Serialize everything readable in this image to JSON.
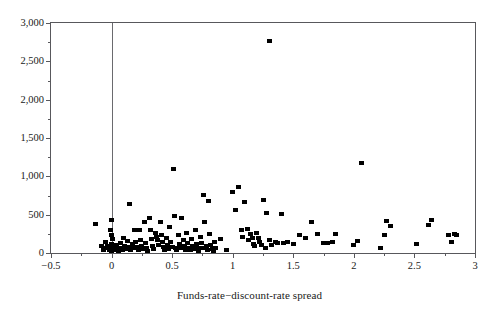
{
  "chart_data": {
    "type": "scatter",
    "title": "",
    "xlabel": "Funds-rate−discount-rate spread",
    "ylabel": "",
    "xlim": [
      -0.5,
      3.0
    ],
    "ylim": [
      0,
      3000
    ],
    "xticks": [
      -0.5,
      0,
      0.5,
      1,
      1.5,
      2,
      2.5,
      3
    ],
    "xticklabels": [
      "−0.5",
      "0",
      "0.5",
      "1",
      "1.5",
      "2",
      "2.5",
      "3"
    ],
    "xminorticks": [
      -0.25,
      0.25,
      0.75,
      1.25,
      1.75,
      2.25,
      2.75
    ],
    "yticks": [
      0,
      500,
      1000,
      1500,
      2000,
      2500,
      3000
    ],
    "yticklabels": [
      "0",
      "500",
      "1,000",
      "1,500",
      "2,000",
      "2,500",
      "3,000"
    ],
    "yminorticks": [
      250,
      750,
      1250,
      1750,
      2250,
      2750
    ],
    "grid": false,
    "legend": null,
    "marker": "square",
    "marker_color": "#000000",
    "reference_lines": [
      {
        "orientation": "vertical",
        "value": 0
      }
    ],
    "points": [
      [
        -0.13,
        375
      ],
      [
        -0.08,
        95
      ],
      [
        -0.07,
        40
      ],
      [
        -0.05,
        150
      ],
      [
        -0.04,
        60
      ],
      [
        -0.03,
        95
      ],
      [
        -0.02,
        35
      ],
      [
        -0.01,
        300
      ],
      [
        0.0,
        430
      ],
      [
        0.0,
        230
      ],
      [
        0.0,
        120
      ],
      [
        0.0,
        60
      ],
      [
        0.0,
        30
      ],
      [
        0.01,
        180
      ],
      [
        0.02,
        90
      ],
      [
        0.03,
        45
      ],
      [
        0.04,
        110
      ],
      [
        0.05,
        60
      ],
      [
        0.06,
        30
      ],
      [
        0.07,
        135
      ],
      [
        0.08,
        70
      ],
      [
        0.09,
        35
      ],
      [
        0.1,
        200
      ],
      [
        0.11,
        95
      ],
      [
        0.12,
        50
      ],
      [
        0.13,
        160
      ],
      [
        0.14,
        75
      ],
      [
        0.15,
        640
      ],
      [
        0.16,
        35
      ],
      [
        0.17,
        115
      ],
      [
        0.18,
        60
      ],
      [
        0.19,
        300
      ],
      [
        0.2,
        150
      ],
      [
        0.21,
        80
      ],
      [
        0.22,
        40
      ],
      [
        0.23,
        300
      ],
      [
        0.24,
        175
      ],
      [
        0.25,
        95
      ],
      [
        0.26,
        50
      ],
      [
        0.27,
        410
      ],
      [
        0.28,
        130
      ],
      [
        0.29,
        70
      ],
      [
        0.3,
        30
      ],
      [
        0.31,
        460
      ],
      [
        0.32,
        300
      ],
      [
        0.33,
        180
      ],
      [
        0.34,
        95
      ],
      [
        0.35,
        55
      ],
      [
        0.36,
        260
      ],
      [
        0.37,
        215
      ],
      [
        0.38,
        170
      ],
      [
        0.39,
        110
      ],
      [
        0.4,
        400
      ],
      [
        0.41,
        230
      ],
      [
        0.42,
        140
      ],
      [
        0.43,
        75
      ],
      [
        0.44,
        35
      ],
      [
        0.45,
        190
      ],
      [
        0.46,
        100
      ],
      [
        0.47,
        55
      ],
      [
        0.48,
        345
      ],
      [
        0.49,
        145
      ],
      [
        0.5,
        80
      ],
      [
        0.51,
        1100
      ],
      [
        0.52,
        480
      ],
      [
        0.53,
        60
      ],
      [
        0.54,
        40
      ],
      [
        0.55,
        230
      ],
      [
        0.56,
        120
      ],
      [
        0.57,
        60
      ],
      [
        0.58,
        460
      ],
      [
        0.59,
        170
      ],
      [
        0.6,
        95
      ],
      [
        0.61,
        45
      ],
      [
        0.62,
        260
      ],
      [
        0.63,
        130
      ],
      [
        0.64,
        65
      ],
      [
        0.65,
        35
      ],
      [
        0.66,
        180
      ],
      [
        0.67,
        90
      ],
      [
        0.68,
        50
      ],
      [
        0.69,
        300
      ],
      [
        0.7,
        120
      ],
      [
        0.71,
        60
      ],
      [
        0.72,
        30
      ],
      [
        0.73,
        210
      ],
      [
        0.74,
        130
      ],
      [
        0.75,
        70
      ],
      [
        0.76,
        760
      ],
      [
        0.77,
        400
      ],
      [
        0.78,
        90
      ],
      [
        0.79,
        45
      ],
      [
        0.8,
        680
      ],
      [
        0.81,
        250
      ],
      [
        0.82,
        110
      ],
      [
        0.83,
        55
      ],
      [
        0.84,
        30
      ],
      [
        0.85,
        140
      ],
      [
        0.86,
        70
      ],
      [
        0.9,
        180
      ],
      [
        0.95,
        40
      ],
      [
        1.0,
        790
      ],
      [
        1.02,
        560
      ],
      [
        1.05,
        860
      ],
      [
        1.07,
        300
      ],
      [
        1.08,
        215
      ],
      [
        1.1,
        660
      ],
      [
        1.12,
        310
      ],
      [
        1.13,
        175
      ],
      [
        1.15,
        245
      ],
      [
        1.16,
        200
      ],
      [
        1.17,
        120
      ],
      [
        1.18,
        95
      ],
      [
        1.2,
        265
      ],
      [
        1.21,
        190
      ],
      [
        1.22,
        150
      ],
      [
        1.24,
        105
      ],
      [
        1.25,
        690
      ],
      [
        1.27,
        60
      ],
      [
        1.28,
        520
      ],
      [
        1.3,
        2770
      ],
      [
        1.3,
        165
      ],
      [
        1.32,
        110
      ],
      [
        1.35,
        145
      ],
      [
        1.37,
        130
      ],
      [
        1.4,
        515
      ],
      [
        1.42,
        135
      ],
      [
        1.45,
        140
      ],
      [
        1.5,
        115
      ],
      [
        1.55,
        240
      ],
      [
        1.6,
        200
      ],
      [
        1.65,
        400
      ],
      [
        1.7,
        250
      ],
      [
        1.75,
        130
      ],
      [
        1.78,
        130
      ],
      [
        1.82,
        140
      ],
      [
        1.85,
        250
      ],
      [
        2.0,
        110
      ],
      [
        2.03,
        160
      ],
      [
        2.06,
        1175
      ],
      [
        2.22,
        60
      ],
      [
        2.25,
        240
      ],
      [
        2.27,
        415
      ],
      [
        2.3,
        350
      ],
      [
        2.52,
        120
      ],
      [
        2.62,
        370
      ],
      [
        2.64,
        425
      ],
      [
        2.78,
        240
      ],
      [
        2.81,
        145
      ],
      [
        2.83,
        250
      ],
      [
        2.85,
        240
      ]
    ]
  }
}
